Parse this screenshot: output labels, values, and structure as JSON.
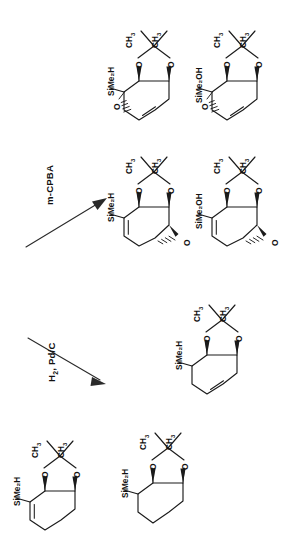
{
  "document": {
    "type": "chemical-reaction-scheme",
    "orientation": "text-rotated-90-ccw",
    "background_color": "#ffffff",
    "ink_color": "#1b1b1b"
  },
  "reagents": [
    {
      "id": "reagent-1",
      "label": "m-CPBA",
      "arrow_direction": "up-right"
    },
    {
      "id": "reagent-2",
      "label": "H2, Pd/C",
      "label_parts": [
        "H",
        "2",
        ", Pd/C"
      ],
      "arrow_direction": "down-right"
    }
  ],
  "atom_labels": {
    "methyl": "CH",
    "methyl_sub": "3",
    "oxygen": "O",
    "silyl_h": "SiMe",
    "silyl_h_sub": "2",
    "silyl_h_tail": "H",
    "silyl_oh": "SiMe",
    "silyl_oh_sub": "2",
    "silyl_oh_tail": "OH"
  },
  "structures": [
    {
      "id": "struct-top-left",
      "row": 1,
      "column": "left",
      "substituent": "SiMe2H",
      "substituent_display": "SiMe₂H",
      "acetonide": true,
      "acetonide_methyls": [
        "CH₃",
        "CH₃"
      ],
      "ring": "cyclohexene",
      "epoxide": true,
      "epoxide_position": "left",
      "epoxide_label": "O",
      "alkene": true
    },
    {
      "id": "struct-top-right",
      "row": 1,
      "column": "right",
      "substituent": "SiMe2OH",
      "substituent_display": "SiMe₂OH",
      "acetonide": true,
      "acetonide_methyls": [
        "CH₃",
        "CH₃"
      ],
      "ring": "cyclohexene",
      "epoxide": true,
      "epoxide_position": "left",
      "epoxide_label": "O",
      "alkene": true
    },
    {
      "id": "struct-mid-left",
      "row": 2,
      "column": "left",
      "substituent": "SiMe2H",
      "substituent_display": "SiMe₂H",
      "acetonide": true,
      "acetonide_methyls": [
        "CH₃",
        "CH₃"
      ],
      "ring": "cyclohexene",
      "epoxide": true,
      "epoxide_position": "right",
      "epoxide_label": "O",
      "alkene": true
    },
    {
      "id": "struct-mid-right",
      "row": 2,
      "column": "right",
      "substituent": "SiMe2OH",
      "substituent_display": "SiMe₂OH",
      "acetonide": true,
      "acetonide_methyls": [
        "CH₃",
        "CH₃"
      ],
      "ring": "cyclohexene",
      "epoxide": true,
      "epoxide_position": "right",
      "epoxide_label": "O",
      "alkene": true
    },
    {
      "id": "struct-row3-right",
      "row": 3,
      "column": "right",
      "substituent": "SiMe2H",
      "substituent_display": "SiMe₂H",
      "acetonide": true,
      "acetonide_methyls": [
        "CH₃",
        "CH₃"
      ],
      "ring": "cyclohexene",
      "epoxide": false,
      "alkene": true
    },
    {
      "id": "struct-bottom-left",
      "row": 4,
      "column": "left",
      "substituent": "SiMe2H",
      "substituent_display": "SiMe₂H",
      "acetonide": true,
      "acetonide_methyls": [
        "CH₃",
        "CH₃"
      ],
      "ring": "cyclohexene",
      "epoxide": false,
      "alkene": true
    },
    {
      "id": "struct-bottom-right",
      "row": 4,
      "column": "right",
      "substituent": "SiMe2H",
      "substituent_display": "SiMe₂H",
      "acetonide": true,
      "acetonide_methyls": [
        "CH₃",
        "CH₃"
      ],
      "ring": "cyclohexane",
      "epoxide": false,
      "alkene": false
    }
  ]
}
